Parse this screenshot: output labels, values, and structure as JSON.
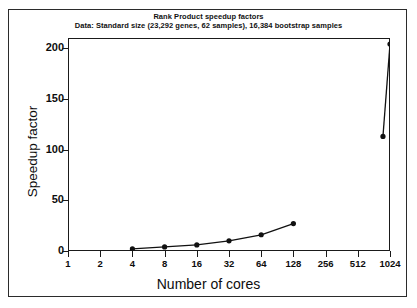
{
  "chart_data": {
    "type": "line",
    "title": "Rank Product speedup factors",
    "subtitle": "Data: Standard size (23,292 genes, 62 samples), 16,384 bootstrap samples",
    "xlabel": "Number of cores",
    "ylabel": "Speedup factor",
    "x_scale": "log2",
    "xlim": [
      1,
      1024
    ],
    "ylim": [
      0,
      210
    ],
    "grid": false,
    "legend": null,
    "x_tick_labels": [
      "1",
      "2",
      "4",
      "8",
      "16",
      "32",
      "64",
      "128",
      "256",
      "512",
      "1024"
    ],
    "x_tick_values": [
      1,
      2,
      4,
      8,
      16,
      32,
      64,
      128,
      256,
      512,
      1024
    ],
    "y_tick_labels": [
      "0",
      "50",
      "100",
      "150",
      "200"
    ],
    "y_tick_values": [
      0,
      50,
      100,
      150,
      200
    ],
    "marker": "filled-circle",
    "line_color": "#111111",
    "marker_color": "#111111",
    "series": [
      {
        "name": "Rank Product speedup",
        "x": [
          4,
          8,
          16,
          32,
          64,
          128,
          880,
          1024
        ],
        "values": [
          2,
          4,
          6,
          10,
          16,
          27,
          113,
          204
        ]
      }
    ]
  },
  "figure": {
    "background_color": "#ffffff",
    "frame_color": "#2b2b2b",
    "axis_color": "#1a1a1a"
  }
}
